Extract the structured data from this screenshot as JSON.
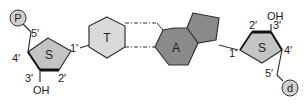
{
  "diagram": {
    "title": "",
    "colors": {
      "sugar_fill": "#c4c4c4",
      "thymine_fill": "#dadada",
      "adenine_fill": "#8a8a8a",
      "phosphate_fill": "#d0d0d0",
      "stroke": "#333333"
    },
    "left_nucleotide": {
      "phosphate": "P",
      "sugar": "S",
      "base": "T",
      "carbon_labels": {
        "c1": "1′",
        "c2": "2′",
        "c3": "3′",
        "c4": "4′",
        "c5": "5′"
      },
      "hydroxyl": "OH"
    },
    "right_nucleotide": {
      "phosphate": "d",
      "sugar": "S",
      "base": "A",
      "carbon_labels": {
        "c1": "1′",
        "c2": "2′",
        "c3": "3′",
        "c4": "4′",
        "c5": "5′"
      },
      "hydroxyl": "OH"
    },
    "hydrogen_bonds": 2
  }
}
